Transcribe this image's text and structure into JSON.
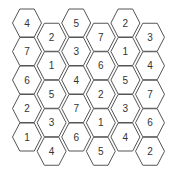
{
  "diagram": {
    "title": "",
    "type": "hexagonal-number-grid",
    "colors": {
      "stroke": "#555555",
      "fill": "#ffffff",
      "text": "#333333"
    },
    "columns": [
      {
        "index": 0,
        "values": [
          "4",
          "7",
          "6",
          "2",
          "1"
        ]
      },
      {
        "index": 1,
        "values": [
          "2",
          "1",
          "5",
          "3",
          "4"
        ]
      },
      {
        "index": 2,
        "values": [
          "5",
          "3",
          "4",
          "7",
          "6"
        ]
      },
      {
        "index": 3,
        "values": [
          "7",
          "6",
          "2",
          "1",
          "5"
        ]
      },
      {
        "index": 4,
        "values": [
          "2",
          "1",
          "5",
          "3",
          "4"
        ]
      },
      {
        "index": 5,
        "values": [
          "3",
          "4",
          "7",
          "6",
          "2"
        ]
      }
    ]
  }
}
